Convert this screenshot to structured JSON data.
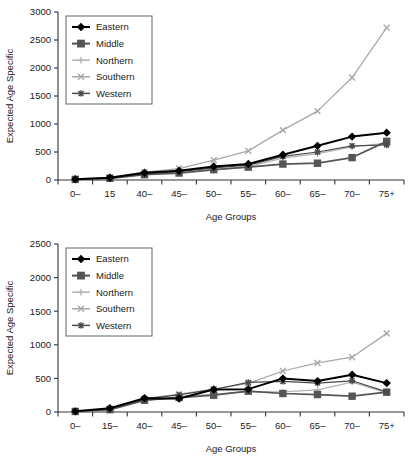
{
  "chart_data": [
    {
      "type": "line",
      "panel": "top",
      "title": "",
      "xlabel": "Age Groups",
      "ylabel": "Expected Age Specific",
      "categories": [
        "0–",
        "15",
        "40–",
        "45–",
        "50–",
        "55–",
        "60–",
        "65–",
        "70–",
        "75+"
      ],
      "ylim": [
        0,
        3000
      ],
      "yticks": [
        0,
        500,
        1000,
        1500,
        2000,
        2500,
        3000
      ],
      "grid": false,
      "legend_position": "top-left",
      "series": [
        {
          "name": "Eastern",
          "color": "#000000",
          "marker": "diamond",
          "values": [
            15,
            40,
            130,
            165,
            240,
            285,
            450,
            610,
            775,
            845
          ]
        },
        {
          "name": "Middle",
          "color": "#555555",
          "marker": "square",
          "values": [
            10,
            30,
            95,
            125,
            185,
            230,
            285,
            300,
            400,
            690
          ]
        },
        {
          "name": "Northern",
          "color": "#b4b4b4",
          "marker": "plus",
          "values": [
            10,
            28,
            100,
            115,
            175,
            240,
            390,
            470,
            590,
            660
          ]
        },
        {
          "name": "Southern",
          "color": "#a8a8a8",
          "marker": "cross",
          "values": [
            18,
            45,
            140,
            205,
            355,
            520,
            890,
            1230,
            1830,
            2720
          ]
        },
        {
          "name": "Western",
          "color": "#4a4a4a",
          "marker": "asterisk",
          "values": [
            12,
            35,
            110,
            150,
            215,
            265,
            420,
            500,
            610,
            625
          ]
        }
      ]
    },
    {
      "type": "line",
      "panel": "bottom",
      "title": "",
      "xlabel": "Age Groups",
      "ylabel": "Expected Age Specific",
      "categories": [
        "0–",
        "15–",
        "40–",
        "45–",
        "50–",
        "55–",
        "60–",
        "65–",
        "70–",
        "75+"
      ],
      "ylim": [
        0,
        2500
      ],
      "yticks": [
        0,
        500,
        1000,
        1500,
        2000,
        2500
      ],
      "grid": false,
      "legend_position": "top-left",
      "series": [
        {
          "name": "Eastern",
          "color": "#000000",
          "marker": "diamond",
          "values": [
            10,
            55,
            205,
            200,
            335,
            340,
            500,
            460,
            555,
            430
          ]
        },
        {
          "name": "Middle",
          "color": "#555555",
          "marker": "square",
          "values": [
            8,
            35,
            175,
            215,
            250,
            310,
            275,
            260,
            235,
            295
          ]
        },
        {
          "name": "Northern",
          "color": "#b4b4b4",
          "marker": "plus",
          "values": [
            8,
            30,
            170,
            225,
            265,
            300,
            300,
            330,
            445,
            285
          ]
        },
        {
          "name": "Southern",
          "color": "#a8a8a8",
          "marker": "cross",
          "values": [
            12,
            50,
            200,
            265,
            340,
            425,
            610,
            730,
            815,
            1170
          ]
        },
        {
          "name": "Western",
          "color": "#4a4a4a",
          "marker": "asterisk",
          "values": [
            10,
            45,
            195,
            255,
            335,
            440,
            455,
            430,
            465,
            300
          ]
        }
      ]
    }
  ],
  "panels": [
    {
      "id": "top",
      "ylabel": "Expected Age Specific",
      "xlabel": "Age Groups",
      "ytick_labels": [
        "3000",
        "2500",
        "2000",
        "1500",
        "1000",
        "500",
        "0"
      ],
      "xtick_labels": [
        "0–",
        "15",
        "40–",
        "45–",
        "50–",
        "55–",
        "60–",
        "65–",
        "70–",
        "75+"
      ],
      "legend": [
        {
          "label": "Eastern",
          "color": "#000000"
        },
        {
          "label": "Middle",
          "color": "#555555"
        },
        {
          "label": "Northern",
          "color": "#b4b4b4"
        },
        {
          "label": "Southern",
          "color": "#a8a8a8"
        },
        {
          "label": "Western",
          "color": "#4a4a4a"
        }
      ]
    },
    {
      "id": "bottom",
      "ylabel": "Expected Age Specific",
      "xlabel": "Age Groups",
      "ytick_labels": [
        "2500",
        "2000",
        "1500",
        "1000",
        "500",
        "0"
      ],
      "xtick_labels": [
        "0–",
        "15–",
        "40–",
        "45–",
        "50–",
        "55–",
        "60–",
        "65–",
        "70–",
        "75+"
      ],
      "legend": [
        {
          "label": "Eastern",
          "color": "#000000"
        },
        {
          "label": "Middle",
          "color": "#555555"
        },
        {
          "label": "Northern",
          "color": "#b4b4b4"
        },
        {
          "label": "Southern",
          "color": "#a8a8a8"
        },
        {
          "label": "Western",
          "color": "#4a4a4a"
        }
      ]
    }
  ],
  "colors": {
    "axis": "#333333",
    "eastern": "#000000",
    "middle": "#555555",
    "northern": "#b4b4b4",
    "southern": "#a8a8a8",
    "western": "#4a4a4a",
    "legend_border": "#555555"
  }
}
